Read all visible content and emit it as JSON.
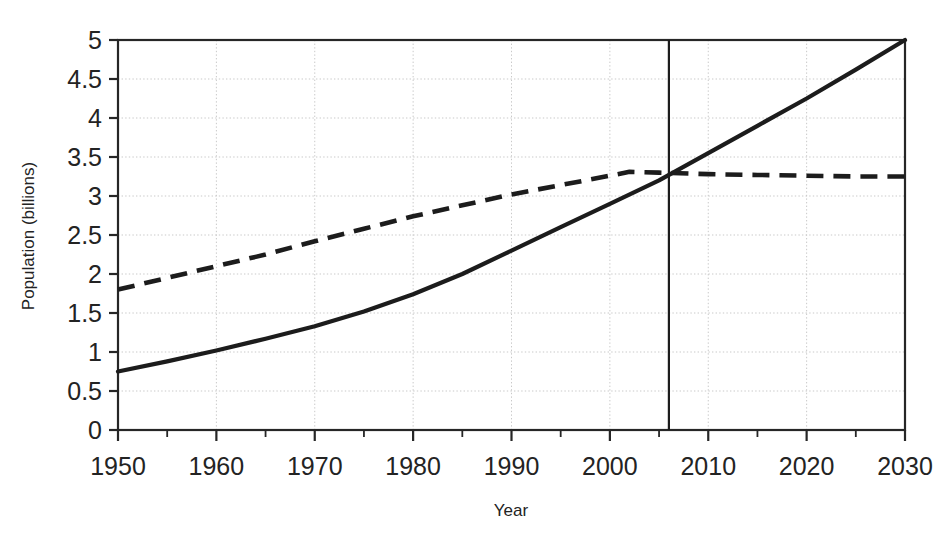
{
  "chart_data": {
    "type": "line",
    "title": "",
    "xlabel": "Year",
    "ylabel": "Population (billions)",
    "xlim": [
      1950,
      2030
    ],
    "ylim": [
      0,
      5
    ],
    "xticks": [
      1950,
      1960,
      1970,
      1980,
      1990,
      2000,
      2010,
      2020,
      2030
    ],
    "xtick_labels": [
      "1950",
      "1960",
      "1970",
      "1980",
      "1990",
      "2000",
      "2010",
      "2020",
      "2030"
    ],
    "x_minor_tick_step": 5,
    "yticks": [
      0,
      0.5,
      1,
      1.5,
      2,
      2.5,
      3,
      3.5,
      4,
      4.5,
      5
    ],
    "ytick_labels": [
      "0",
      "0.5",
      "1",
      "1.5",
      "2",
      "2.5",
      "3",
      "3.5",
      "4",
      "4.5",
      "5"
    ],
    "grid": true,
    "grid_axis": "both",
    "legend": false,
    "legend_position": "none",
    "annotations": [
      {
        "name": "present-year-marker",
        "type": "vertical-line",
        "x": 2006,
        "style": "solid",
        "label": ""
      }
    ],
    "series": [
      {
        "name": "urban-population",
        "style": "solid",
        "x": [
          1950,
          1955,
          1960,
          1965,
          1970,
          1975,
          1980,
          1985,
          1990,
          1995,
          2000,
          2005,
          2010,
          2015,
          2020,
          2025,
          2030
        ],
        "values": [
          0.75,
          0.88,
          1.02,
          1.17,
          1.33,
          1.52,
          1.74,
          2.0,
          2.3,
          2.6,
          2.9,
          3.2,
          3.55,
          3.9,
          4.25,
          4.62,
          5.0
        ]
      },
      {
        "name": "rural-population",
        "style": "dashed",
        "x": [
          1950,
          1955,
          1960,
          1965,
          1970,
          1975,
          1980,
          1985,
          1990,
          1995,
          2000,
          2002,
          2005,
          2010,
          2015,
          2020,
          2025,
          2030
        ],
        "values": [
          1.8,
          1.95,
          2.1,
          2.25,
          2.42,
          2.58,
          2.74,
          2.88,
          3.02,
          3.14,
          3.26,
          3.31,
          3.3,
          3.28,
          3.27,
          3.26,
          3.25,
          3.25
        ]
      }
    ]
  },
  "colors": {
    "series_ink": "#1c1c1c",
    "axis": "#262626",
    "grid": "#c9c9c9",
    "background": "#ffffff"
  }
}
